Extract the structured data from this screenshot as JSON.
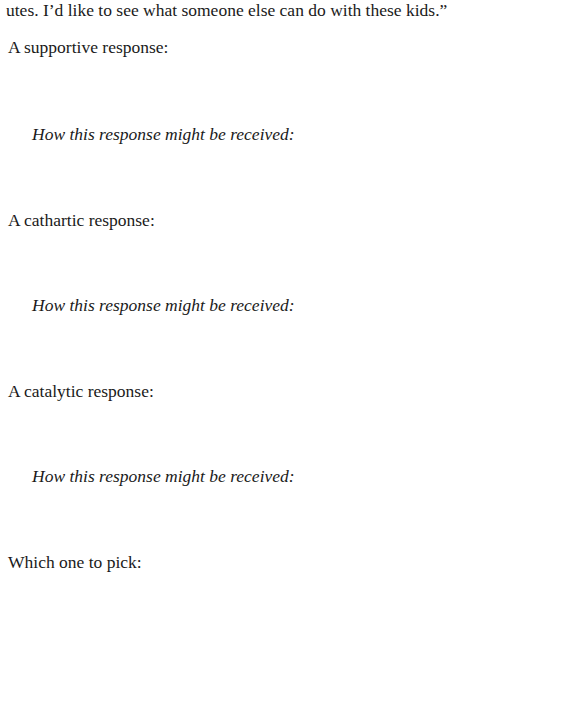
{
  "document": {
    "continuation_text": "utes. I’d like to see what someone else can do with these kids.”",
    "sections": [
      {
        "prompt": "A supportive response:",
        "reception_label": "How this response might be received:"
      },
      {
        "prompt": "A cathartic response:",
        "reception_label": "How this response might be received:"
      },
      {
        "prompt": "A catalytic response:",
        "reception_label": "How this response might be received:"
      }
    ],
    "final_prompt": "Which one to pick:"
  }
}
